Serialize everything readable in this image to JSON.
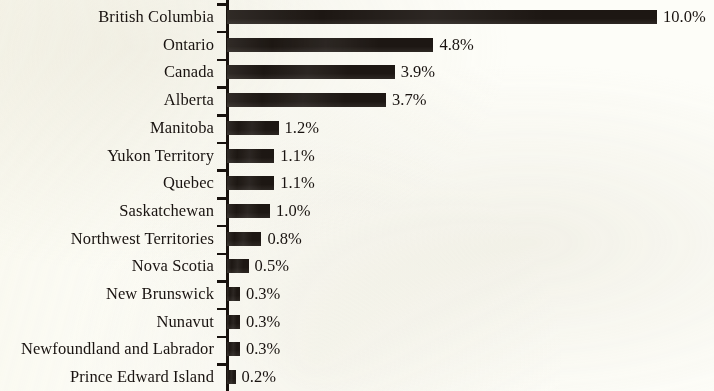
{
  "chart_data": {
    "type": "bar",
    "orientation": "horizontal",
    "title": "",
    "subtitle": "",
    "xlabel": "",
    "ylabel": "",
    "xlim": [
      0,
      10
    ],
    "grid": false,
    "legend": null,
    "value_format": "{v}%",
    "bar_color": "#1d1713",
    "background_color": "#fdfdf8",
    "axis_color": "#18120e",
    "text_color": "#191310",
    "categories": [
      "British Columbia",
      "Ontario",
      "Canada",
      "Alberta",
      "Manitoba",
      "Yukon Territory",
      "Quebec",
      "Saskatchewan",
      "Northwest Territories",
      "Nova Scotia",
      "New Brunswick",
      "Nunavut",
      "Newfoundland and Labrador",
      "Prince Edward Island"
    ],
    "values": [
      10.0,
      4.8,
      3.9,
      3.7,
      1.2,
      1.1,
      1.1,
      1.0,
      0.8,
      0.5,
      0.3,
      0.3,
      0.3,
      0.2
    ],
    "value_labels": [
      "10.0%",
      "4.8%",
      "3.9%",
      "3.7%",
      "1.2%",
      "1.1%",
      "1.1%",
      "1.0%",
      "0.8%",
      "0.5%",
      "0.3%",
      "0.3%",
      "0.3%",
      "0.2%"
    ]
  }
}
